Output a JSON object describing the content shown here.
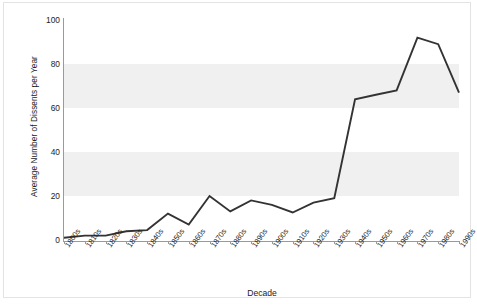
{
  "chart_data": {
    "type": "line",
    "title": "",
    "subtitle": "",
    "xlabel": "Decade",
    "ylabel": "Average Number of Dissents per Year",
    "categories": [
      "1800s",
      "1810s",
      "1820s",
      "1830s",
      "1840s",
      "1850s",
      "1860s",
      "1870s",
      "1880s",
      "1890s",
      "1900s",
      "1910s",
      "1920s",
      "1930s",
      "1940s",
      "1950s",
      "1960s",
      "1970s",
      "1980s",
      "1990s"
    ],
    "values": [
      1,
      2,
      2,
      4,
      4.5,
      12,
      7,
      20,
      13,
      18,
      16,
      12.5,
      17,
      19,
      64,
      66,
      68,
      92,
      89,
      67
    ],
    "series": [
      {
        "name": "Average Number of Dissents per Year",
        "values": [
          1,
          2,
          2,
          4,
          4.5,
          12,
          7,
          20,
          13,
          18,
          16,
          12.5,
          17,
          19,
          64,
          66,
          68,
          92,
          89,
          67
        ]
      }
    ],
    "ylim": [
      0,
      100
    ],
    "y_ticks": [
      0,
      20,
      40,
      60,
      80,
      100
    ],
    "y_tick_labels": [
      "0",
      "20",
      "40",
      "60",
      "80",
      "100"
    ],
    "grid": false,
    "banded_background": true,
    "legend": false,
    "legend_position": "none",
    "line_color": "#333333",
    "band_color": "#f0f0f0",
    "plot_background": "#ffffff",
    "axis_color": "#9a9a9a",
    "text_color": "#1c1c1c"
  },
  "axes": {
    "y_title": "Average Number of Dissents per Year",
    "x_title": "Decade"
  }
}
